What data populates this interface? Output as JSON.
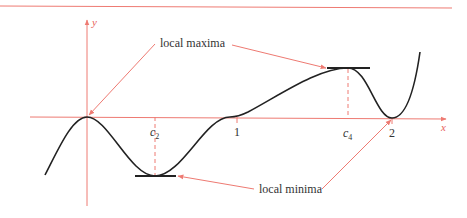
{
  "colors": {
    "axis": "#ee7a72",
    "curve": "#222222",
    "text": "#333333"
  },
  "axes": {
    "x_label": "x",
    "y_label": "y"
  },
  "ticks": {
    "c2": "c",
    "c2_sub": "2",
    "one": "1",
    "c4": "c",
    "c4_sub": "4",
    "two": "2"
  },
  "annotations": {
    "maxima": "local maxima",
    "minima": "local minima"
  }
}
